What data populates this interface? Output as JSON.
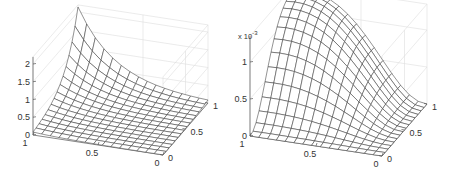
{
  "chart_data": [
    {
      "type": "surface",
      "title": "",
      "xlabel": "",
      "ylabel": "",
      "zlabel": "",
      "grid": true,
      "mesh_resolution": 15,
      "x_ticks": [
        "1",
        "0.5",
        "0"
      ],
      "y_ticks": [
        "0",
        "0.5",
        "1"
      ],
      "z_ticks": [
        "0",
        "0.5",
        "1",
        "1.5",
        "2"
      ],
      "xlim": [
        0,
        1
      ],
      "ylim": [
        0,
        1
      ],
      "zlim": [
        0,
        2.2
      ],
      "description": "Wireframe surface rising steeply toward corner (x=1,y=1) to ~2.1, near zero elsewhere",
      "corner_values": {
        "x0_y0": 0.0,
        "x1_y0": 0.05,
        "x0_y1": 0.05,
        "x1_y1": 2.1
      },
      "projection": {
        "front_left": [
          33,
          137
        ],
        "front_right": [
          163,
          157
        ],
        "back_right": [
          208,
          105
        ],
        "z_zero_px": 135,
        "z_px_per_unit": 35.5
      }
    },
    {
      "type": "surface",
      "title": "",
      "xlabel": "",
      "ylabel": "",
      "zlabel": "",
      "grid": true,
      "mesh_resolution": 15,
      "z_exponent_label": "x 10",
      "z_exponent": "-3",
      "x_ticks": [
        "1",
        "0.5",
        "0"
      ],
      "y_ticks": [
        "0",
        "0.5",
        "1"
      ],
      "z_ticks": [
        "0",
        "0.5",
        "1"
      ],
      "xlim": [
        0,
        1
      ],
      "ylim": [
        0,
        1
      ],
      "zlim": [
        0,
        0.00135
      ],
      "description": "Wireframe surface with a single peak ~1.3e-3 near (x≈0.9, y≈0.85), zero along x=0 and y=0 edges",
      "peak_value": 0.0013,
      "projection": {
        "front_left": [
          250,
          137
        ],
        "front_right": [
          382,
          157
        ],
        "back_right": [
          427,
          105
        ],
        "z_zero_px": 136,
        "z_px_per_unit": 74000
      }
    }
  ]
}
